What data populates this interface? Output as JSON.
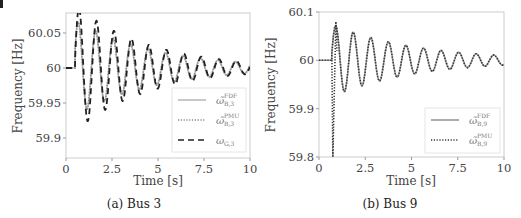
{
  "chart_data": [
    {
      "type": "line",
      "caption": "(a) Bus 3",
      "xlabel": "Time [s]",
      "ylabel": "Frequency [Hz]",
      "xlim": [
        0,
        10
      ],
      "ylim": [
        59.87,
        60.08
      ],
      "xticks": [
        "0",
        "2.5",
        "5",
        "7.5",
        "10"
      ],
      "yticks": [
        "60.05",
        "60",
        "59.95",
        "59.9"
      ],
      "ytick_values": [
        60.05,
        60.0,
        59.95,
        59.9
      ],
      "grid": false,
      "legend_position": "lower right",
      "disturbance_time": 0.5,
      "series": [
        {
          "name": "ω̃B,3 FDF",
          "label_main": "ω̃",
          "sup": "FDF",
          "sub": "B,3",
          "style": "solid",
          "color": "#bbbbbb",
          "amp0": 0.068,
          "decay": 0.23,
          "period": 0.95,
          "phase": 0.25,
          "offset": 0.0
        },
        {
          "name": "ω̃B,3 PMU",
          "label_main": "ω̃",
          "sup": "PMU",
          "sub": "B,3",
          "style": "dotted",
          "color": "#888888",
          "amp0": 0.068,
          "decay": 0.23,
          "period": 0.95,
          "phase": 0.25,
          "offset": 0.0
        },
        {
          "name": "ωG,3",
          "label_main": "ω",
          "sup": "",
          "sub": "G,3",
          "style": "dashed",
          "color": "#222222",
          "amp0": 0.09,
          "decay": 0.25,
          "period": 0.95,
          "phase": 0.1,
          "offset": 0.0
        }
      ]
    },
    {
      "type": "line",
      "caption": "(b) Bus 9",
      "xlabel": "Time [s]",
      "ylabel": "Frequency [Hz]",
      "xlim": [
        0,
        10
      ],
      "ylim": [
        59.8,
        60.1
      ],
      "xticks": [
        "0",
        "2.5",
        "5",
        "7.5",
        "10"
      ],
      "yticks": [
        "60.1",
        "60",
        "59.9",
        "59.8"
      ],
      "ytick_values": [
        60.1,
        60.0,
        59.9,
        59.8
      ],
      "grid": false,
      "legend_position": "lower right",
      "disturbance_time": 0.7,
      "series": [
        {
          "name": "ω̃B,9 FDF",
          "label_main": "ω̃",
          "sup": "FDF",
          "sub": "B,9",
          "style": "solid",
          "color": "#999999",
          "amp0": 0.075,
          "decay": 0.22,
          "period": 0.95,
          "phase": 0.12,
          "offset": 0.0
        },
        {
          "name": "ω̃B,9 PMU",
          "label_main": "ω̃",
          "sup": "PMU",
          "sub": "B,9",
          "style": "dotted",
          "color": "#333333",
          "amp0": 0.075,
          "decay": 0.22,
          "period": 0.95,
          "phase": 0.12,
          "offset": 0.0,
          "spike": {
            "t": 0.75,
            "high": 60.08,
            "low": 59.8
          }
        }
      ]
    }
  ]
}
